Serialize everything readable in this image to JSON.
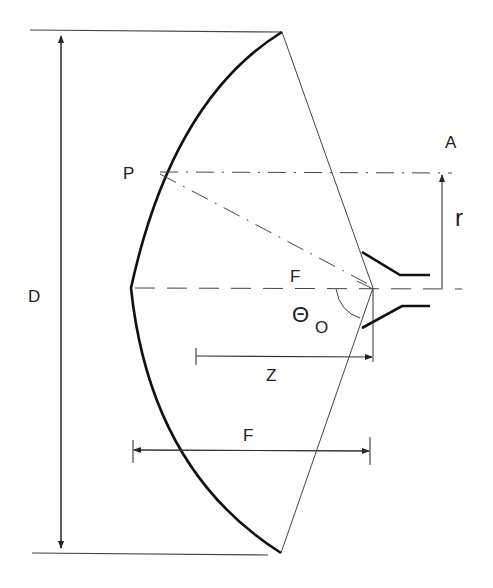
{
  "diagram": {
    "labels": {
      "diameter": "D",
      "point": "P",
      "aperture_point": "A",
      "radius": "r",
      "focus": "F",
      "angle_symbol": "Θ",
      "angle_subscript": "O",
      "z_dimension": "Z",
      "focal_length": "F"
    },
    "colors": {
      "line": "#333333",
      "dish": "#111111",
      "background": "#ffffff"
    }
  }
}
